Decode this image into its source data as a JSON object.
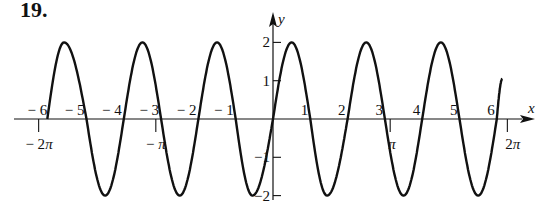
{
  "problem": {
    "number": "19."
  },
  "chart_data": {
    "type": "line",
    "title": "",
    "xlabel": "x",
    "ylabel": "y",
    "xlim": [
      -6.3,
      6.4
    ],
    "ylim": [
      -2,
      2
    ],
    "grid": false,
    "legend": null,
    "x_tick_labels": [
      "-6",
      "-5",
      "-4",
      "-3",
      "-2",
      "-1",
      "1",
      "2",
      "3",
      "4",
      "5",
      "6"
    ],
    "x_tick_positions": [
      -6,
      -5,
      -4,
      -3,
      -2,
      -1,
      1,
      2,
      3,
      4,
      5,
      6
    ],
    "pi_ticks": [
      {
        "label": "-2π",
        "value": -6.283
      },
      {
        "label": "-π",
        "value": -3.1416
      },
      {
        "label": "π",
        "value": 3.1416
      },
      {
        "label": "2π",
        "value": 6.283
      }
    ],
    "y_tick_labels": [
      "2",
      "1",
      "-1",
      "-2"
    ],
    "y_tick_positions": [
      2,
      1,
      -1,
      -2
    ],
    "series": [
      {
        "name": "curve",
        "description": "oscillating curve with amplitude 2 crossing zero near each integer",
        "x": [
          -6.05,
          -5.6,
          -5.0,
          -4.5,
          -4.0,
          -3.5,
          -3.0,
          -2.5,
          -2.0,
          -1.5,
          -1.0,
          -0.55,
          0.0,
          0.5,
          1.0,
          1.45,
          2.0,
          2.5,
          3.0,
          3.5,
          4.0,
          4.5,
          5.0,
          5.5,
          6.0,
          6.15
        ],
        "y": [
          0,
          2,
          0,
          -2,
          0,
          2,
          0,
          -2,
          0,
          2,
          0,
          -2,
          0,
          2,
          0,
          -2,
          0,
          2,
          0,
          -2,
          0,
          2,
          0,
          -2,
          0,
          1.05
        ]
      }
    ]
  },
  "axes": {
    "x_axis_label": "x",
    "y_axis_label": "y"
  }
}
